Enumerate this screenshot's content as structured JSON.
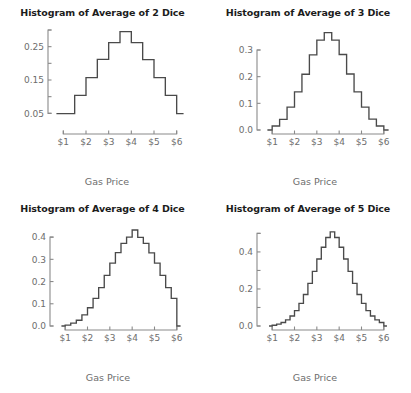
{
  "figure": {
    "background_color": "#ffffff",
    "line_color": "#4a4a4a",
    "axis_color": "#8a8a8a",
    "tick_label_color": "#6d6d6d",
    "title_color": "#1c1c1c"
  },
  "chart_data": [
    {
      "type": "bar",
      "panel_id": "hist-2-dice",
      "title": "Histogram of Average of 2 Dice",
      "xlabel": "Gas Price",
      "ylabel": "",
      "grid": false,
      "legend": "none",
      "xlim": [
        0.5,
        6.5
      ],
      "ylim": [
        0.0,
        0.3
      ],
      "xticks": [
        1,
        2,
        3,
        4,
        5,
        6
      ],
      "xticklabels": [
        "$1",
        "$2",
        "$3",
        "$4",
        "$5",
        "$6"
      ],
      "yticks": [
        0.05,
        0.15,
        0.25
      ],
      "yticklabels": [
        "0.05",
        "0.15",
        "0.25"
      ],
      "yminorticks": [
        0.1,
        0.2,
        0.3
      ],
      "bin_width": 0.5,
      "bin_edges": [
        1.0,
        1.5,
        2.0,
        2.5,
        3.0,
        3.5,
        4.0,
        4.5,
        5.0,
        5.5,
        6.0
      ],
      "bin_centers": [
        1.25,
        1.75,
        2.25,
        2.75,
        3.25,
        3.75,
        4.25,
        4.75,
        5.25,
        5.75
      ],
      "values": [
        0.049,
        0.104,
        0.157,
        0.212,
        0.262,
        0.295,
        0.262,
        0.211,
        0.157,
        0.104
      ],
      "baseline": 0.049
    },
    {
      "type": "bar",
      "panel_id": "hist-3-dice",
      "title": "Histogram of Average of 3 Dice",
      "xlabel": "Gas Price",
      "ylabel": "",
      "grid": false,
      "legend": "none",
      "xlim": [
        0.5,
        6.5
      ],
      "ylim": [
        0.0,
        0.375
      ],
      "xticks": [
        1,
        2,
        3,
        4,
        5,
        6
      ],
      "xticklabels": [
        "$1",
        "$2",
        "$3",
        "$4",
        "$5",
        "$6"
      ],
      "yticks": [
        0.0,
        0.1,
        0.2,
        0.3
      ],
      "yticklabels": [
        "0.0",
        "0.1",
        "0.2",
        "0.3"
      ],
      "bin_width": 0.3333,
      "bin_edges": [
        1.0,
        1.333,
        1.667,
        2.0,
        2.333,
        2.667,
        3.0,
        3.333,
        3.667,
        4.0,
        4.333,
        4.667,
        5.0,
        5.333,
        5.667,
        6.0
      ],
      "values": [
        0.015,
        0.04,
        0.086,
        0.143,
        0.209,
        0.282,
        0.337,
        0.365,
        0.337,
        0.283,
        0.21,
        0.143,
        0.086,
        0.041,
        0.015
      ],
      "baseline": 0.0
    },
    {
      "type": "bar",
      "panel_id": "hist-4-dice",
      "title": "Histogram of Average of 4 Dice",
      "xlabel": "Gas Price",
      "ylabel": "",
      "grid": false,
      "legend": "none",
      "xlim": [
        0.5,
        6.5
      ],
      "ylim": [
        0.0,
        0.45
      ],
      "xticks": [
        1,
        2,
        3,
        4,
        5,
        6
      ],
      "xticklabels": [
        "$1",
        "$2",
        "$3",
        "$4",
        "$5",
        "$6"
      ],
      "yticks": [
        0.0,
        0.1,
        0.2,
        0.3,
        0.4
      ],
      "yticklabels": [
        "0.0",
        "0.1",
        "0.2",
        "0.3",
        "0.4"
      ],
      "bin_width": 0.25,
      "bin_edges": [
        1.0,
        1.25,
        1.5,
        1.75,
        2.0,
        2.25,
        2.5,
        2.75,
        3.0,
        3.25,
        3.5,
        3.75,
        4.0,
        4.25,
        4.5,
        4.75,
        5.0,
        5.25,
        5.5,
        5.75,
        6.0
      ],
      "values": [
        0.004,
        0.013,
        0.026,
        0.05,
        0.082,
        0.124,
        0.173,
        0.228,
        0.283,
        0.33,
        0.372,
        0.4,
        0.432,
        0.399,
        0.372,
        0.329,
        0.283,
        0.228,
        0.173,
        0.124,
        0.082,
        0.05,
        0.026,
        0.013,
        0.004
      ],
      "baseline": 0.0
    },
    {
      "type": "bar",
      "panel_id": "hist-5-dice",
      "title": "Histogram of Average of 5 Dice",
      "xlabel": "Gas Price",
      "ylabel": "",
      "grid": false,
      "legend": "none",
      "xlim": [
        0.5,
        6.5
      ],
      "ylim": [
        0.0,
        0.54
      ],
      "xticks": [
        1,
        2,
        3,
        4,
        5,
        6
      ],
      "xticklabels": [
        "$1",
        "$2",
        "$3",
        "$4",
        "$5",
        "$6"
      ],
      "yticks": [
        0.0,
        0.2,
        0.4
      ],
      "yticklabels": [
        "0.0",
        "0.2",
        "0.4"
      ],
      "yminorticks": [
        0.1,
        0.3,
        0.5
      ],
      "bin_width": 0.2,
      "bin_edges": [
        1.0,
        1.2,
        1.4,
        1.6,
        1.8,
        2.0,
        2.2,
        2.4,
        2.6,
        2.8,
        3.0,
        3.2,
        3.4,
        3.6,
        3.8,
        4.0,
        4.2,
        4.4,
        4.6,
        4.8,
        5.0,
        5.2,
        5.4,
        5.6,
        5.8,
        6.0
      ],
      "values": [
        0.004,
        0.01,
        0.019,
        0.033,
        0.054,
        0.083,
        0.122,
        0.17,
        0.23,
        0.295,
        0.362,
        0.425,
        0.478,
        0.508,
        0.478,
        0.425,
        0.362,
        0.295,
        0.23,
        0.17,
        0.122,
        0.083,
        0.054,
        0.033,
        0.019,
        0.01,
        0.004
      ],
      "baseline": 0.0
    }
  ],
  "panels": [
    {
      "title": "Histogram of Average of 2 Dice",
      "xlabel": "Gas Price",
      "yticklabels": [
        "0.05",
        "0.15",
        "0.25"
      ],
      "xticklabels": [
        "$1",
        "$2",
        "$3",
        "$4",
        "$5",
        "$6"
      ]
    },
    {
      "title": "Histogram of Average of 3 Dice",
      "xlabel": "Gas Price",
      "yticklabels": [
        "0.0",
        "0.1",
        "0.2",
        "0.3"
      ],
      "xticklabels": [
        "$1",
        "$2",
        "$3",
        "$4",
        "$5",
        "$6"
      ]
    },
    {
      "title": "Histogram of Average of 4 Dice",
      "xlabel": "Gas Price",
      "yticklabels": [
        "0.0",
        "0.1",
        "0.2",
        "0.3",
        "0.4"
      ],
      "xticklabels": [
        "$1",
        "$2",
        "$3",
        "$4",
        "$5",
        "$6"
      ]
    },
    {
      "title": "Histogram of Average of 5 Dice",
      "xlabel": "Gas Price",
      "yticklabels": [
        "0.0",
        "0.2",
        "0.4"
      ],
      "xticklabels": [
        "$1",
        "$2",
        "$3",
        "$4",
        "$5",
        "$6"
      ]
    }
  ]
}
